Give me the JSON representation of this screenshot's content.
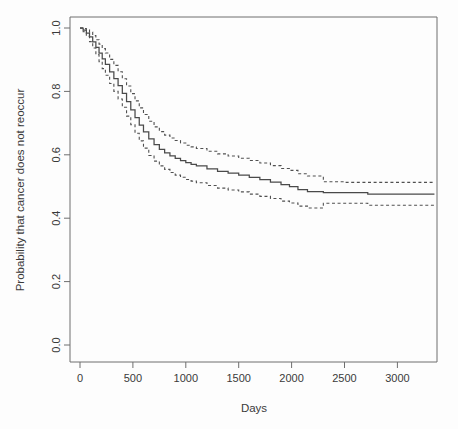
{
  "chart_data": {
    "type": "line",
    "title": "",
    "subtitle": "",
    "xlabel": "Days",
    "ylabel": "Probability that cancer does not reoccur",
    "xlim": [
      0,
      3350
    ],
    "ylim": [
      0.0,
      1.0
    ],
    "grid": false,
    "legend_position": "none",
    "xticks": [
      0,
      500,
      1000,
      1500,
      2000,
      2500,
      3000
    ],
    "xtick_labels": [
      "0",
      "500",
      "1000",
      "1500",
      "2000",
      "2500",
      "3000"
    ],
    "yticks": [
      0.0,
      0.2,
      0.4,
      0.6,
      0.8,
      1.0
    ],
    "ytick_labels": [
      "0.0",
      "0.2",
      "0.4",
      "0.6",
      "0.8",
      "1.0"
    ],
    "series": [
      {
        "name": "Kaplan-Meier estimate",
        "style": "solid",
        "color": "#4a4a4a",
        "x": [
          0,
          30,
          60,
          90,
          120,
          150,
          180,
          210,
          240,
          280,
          320,
          360,
          400,
          440,
          480,
          520,
          560,
          600,
          650,
          700,
          750,
          800,
          850,
          900,
          950,
          1000,
          1050,
          1100,
          1200,
          1300,
          1400,
          1500,
          1600,
          1700,
          1800,
          1900,
          1980,
          2060,
          2150,
          2300,
          2500,
          2700,
          2720,
          3000,
          3350
        ],
        "y": [
          1.0,
          0.993,
          0.984,
          0.972,
          0.956,
          0.939,
          0.921,
          0.903,
          0.885,
          0.862,
          0.84,
          0.818,
          0.794,
          0.768,
          0.742,
          0.717,
          0.694,
          0.672,
          0.65,
          0.632,
          0.617,
          0.606,
          0.597,
          0.589,
          0.582,
          0.575,
          0.57,
          0.565,
          0.556,
          0.548,
          0.542,
          0.536,
          0.529,
          0.522,
          0.514,
          0.506,
          0.5,
          0.49,
          0.484,
          0.481,
          0.481,
          0.481,
          0.476,
          0.476,
          0.476
        ]
      },
      {
        "name": "Upper 95% confidence limit",
        "style": "dashed",
        "color": "#505050",
        "x": [
          0,
          30,
          60,
          90,
          120,
          150,
          180,
          210,
          240,
          280,
          320,
          360,
          400,
          440,
          480,
          520,
          560,
          600,
          650,
          700,
          750,
          800,
          850,
          900,
          950,
          1000,
          1050,
          1100,
          1200,
          1300,
          1400,
          1500,
          1600,
          1700,
          1800,
          1900,
          1980,
          2060,
          2150,
          2300,
          2500,
          2700,
          2720,
          3000,
          3350
        ],
        "y": [
          1.0,
          0.998,
          0.994,
          0.987,
          0.976,
          0.963,
          0.949,
          0.935,
          0.921,
          0.901,
          0.882,
          0.862,
          0.84,
          0.817,
          0.793,
          0.77,
          0.748,
          0.727,
          0.706,
          0.688,
          0.673,
          0.662,
          0.653,
          0.645,
          0.637,
          0.63,
          0.625,
          0.62,
          0.611,
          0.603,
          0.596,
          0.589,
          0.582,
          0.574,
          0.566,
          0.557,
          0.551,
          0.54,
          0.533,
          0.515,
          0.513,
          0.513,
          0.513,
          0.513,
          0.513
        ]
      },
      {
        "name": "Lower 95% confidence limit",
        "style": "dashed",
        "color": "#505050",
        "x": [
          0,
          30,
          60,
          90,
          120,
          150,
          180,
          210,
          240,
          280,
          320,
          360,
          400,
          440,
          480,
          520,
          560,
          600,
          650,
          700,
          750,
          800,
          850,
          900,
          950,
          1000,
          1050,
          1100,
          1200,
          1300,
          1400,
          1500,
          1600,
          1700,
          1800,
          1900,
          1980,
          2060,
          2150,
          2300,
          2500,
          2700,
          2720,
          3000,
          3350
        ],
        "y": [
          1.0,
          0.988,
          0.974,
          0.957,
          0.937,
          0.916,
          0.894,
          0.872,
          0.851,
          0.825,
          0.8,
          0.776,
          0.75,
          0.722,
          0.695,
          0.668,
          0.644,
          0.621,
          0.598,
          0.58,
          0.565,
          0.554,
          0.544,
          0.536,
          0.529,
          0.522,
          0.517,
          0.512,
          0.503,
          0.495,
          0.489,
          0.483,
          0.476,
          0.469,
          0.462,
          0.454,
          0.448,
          0.438,
          0.432,
          0.447,
          0.447,
          0.447,
          0.441,
          0.441,
          0.441
        ]
      }
    ],
    "annotations": []
  },
  "plot_geometry": {
    "left": 70,
    "right": 437,
    "top": 17,
    "bottom": 362,
    "x0_px": 80,
    "x_px_per_unit": 0.1058,
    "y_1_0_px": 28,
    "y_0_0_px": 345
  }
}
